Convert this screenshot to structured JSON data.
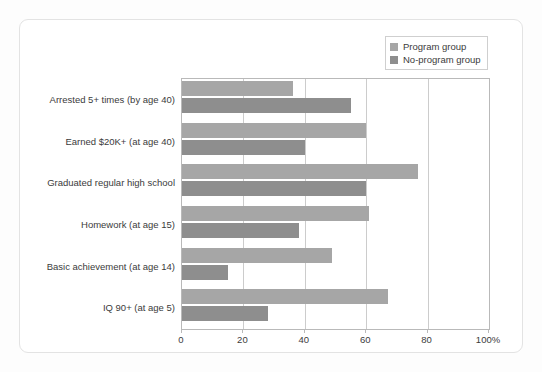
{
  "chart_data": {
    "type": "bar",
    "orientation": "horizontal",
    "title": "",
    "subtitle": "",
    "xlabel": "",
    "ylabel": "",
    "xlim": [
      0,
      100
    ],
    "grid": true,
    "legend_position": "top-right",
    "categories": [
      "Arrested 5+ times (by age 40)",
      "Earned $20K+ (at age 40)",
      "Graduated regular high school",
      "Homework (at age 15)",
      "Basic achievement (at age 14)",
      "IQ 90+ (at age 5)"
    ],
    "series": [
      {
        "name": "Program group",
        "color": "#a6a6a6",
        "values": [
          36,
          60,
          77,
          61,
          49,
          67
        ]
      },
      {
        "name": "No-program group",
        "color": "#8e8e8e",
        "values": [
          55,
          40,
          60,
          38,
          15,
          28
        ]
      }
    ],
    "xticks": [
      {
        "value": 0,
        "label": "0"
      },
      {
        "value": 20,
        "label": "20"
      },
      {
        "value": 40,
        "label": "40"
      },
      {
        "value": 60,
        "label": "60"
      },
      {
        "value": 80,
        "label": "80"
      },
      {
        "value": 100,
        "label": "100%"
      }
    ]
  },
  "legend": {
    "items": [
      {
        "label": "Program group",
        "color": "#a6a6a6"
      },
      {
        "label": "No-program group",
        "color": "#8e8e8e"
      }
    ]
  },
  "colors": {
    "card_background": "#ffffff",
    "card_border": "#e3e3e3",
    "page_background": "#fdfdfd",
    "axis": "#b9b9b9",
    "gridline": "#cccccc",
    "text": "#3b3b3b"
  }
}
